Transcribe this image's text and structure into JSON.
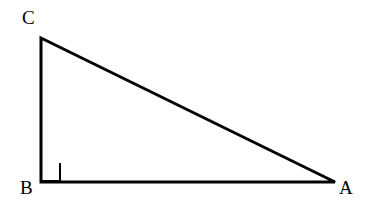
{
  "figure": {
    "kind": "geometry-diagram",
    "shape": "right-triangle",
    "background_color": "#ffffff",
    "stroke_color": "#000000",
    "stroke_width": 3,
    "canvas": {
      "width": 375,
      "height": 222
    },
    "vertices": [
      {
        "name": "C",
        "label": "C",
        "x": 41,
        "y": 38,
        "label_x": 22,
        "label_y": 8,
        "role": "apex-top-left"
      },
      {
        "name": "B",
        "label": "B",
        "x": 41,
        "y": 182,
        "label_x": 20,
        "label_y": 178,
        "role": "right-angle-vertex"
      },
      {
        "name": "A",
        "label": "A",
        "x": 335,
        "y": 182,
        "label_x": 339,
        "label_y": 178,
        "role": "vertex-bottom-right"
      }
    ],
    "sides": [
      {
        "name": "CB",
        "from": "C",
        "to": "B",
        "kind": "vertical-leg"
      },
      {
        "name": "BA",
        "from": "B",
        "to": "A",
        "kind": "horizontal-leg"
      },
      {
        "name": "AC",
        "from": "A",
        "to": "C",
        "kind": "hypotenuse"
      }
    ],
    "right_angle_marker": {
      "at_vertex": "B",
      "size": 19,
      "stroke_width": 2,
      "x": 41,
      "y": 182
    }
  }
}
